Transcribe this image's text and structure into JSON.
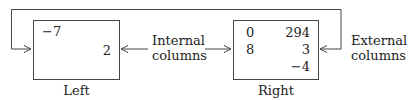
{
  "diagram": {
    "left_box": {
      "caption": "Left",
      "values": {
        "top_left": "−7",
        "middle_right": "2"
      }
    },
    "right_box": {
      "caption": "Right",
      "rows": [
        {
          "col1": "0",
          "col2": "294"
        },
        {
          "col1": "8",
          "col2": "3"
        },
        {
          "col1": "",
          "col2": "−4"
        }
      ]
    },
    "internal_label": {
      "line1": "Internal",
      "line2": "columns"
    },
    "external_label": {
      "line1": "External",
      "line2": "columns"
    },
    "colors": {
      "stroke": "#444444",
      "text": "#222222",
      "background": "#ffffff"
    }
  }
}
